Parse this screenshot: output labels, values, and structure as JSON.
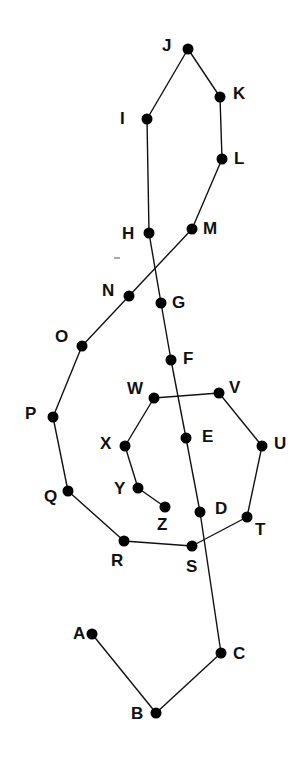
{
  "diagram": {
    "type": "connect-the-dots",
    "colors": {
      "line": "#111111",
      "dot": "#000000",
      "label": "#111111",
      "background": "#ffffff"
    },
    "path_order": [
      "A",
      "B",
      "C",
      "D",
      "E",
      "F",
      "G",
      "H",
      "I",
      "J",
      "K",
      "L",
      "M",
      "N",
      "O",
      "P",
      "Q",
      "R",
      "S",
      "T",
      "U",
      "V",
      "W",
      "X",
      "Y",
      "Z"
    ],
    "points": [
      {
        "id": "A",
        "label": "A",
        "x": 92,
        "y": 634,
        "lx": 73,
        "ly": 639
      },
      {
        "id": "B",
        "label": "B",
        "x": 156,
        "y": 713,
        "lx": 131,
        "ly": 719
      },
      {
        "id": "C",
        "label": "C",
        "x": 221,
        "y": 653,
        "lx": 233,
        "ly": 659
      },
      {
        "id": "D",
        "label": "D",
        "x": 200,
        "y": 512,
        "lx": 215,
        "ly": 514
      },
      {
        "id": "E",
        "label": "E",
        "x": 186,
        "y": 438,
        "lx": 202,
        "ly": 442
      },
      {
        "id": "F",
        "label": "F",
        "x": 171,
        "y": 360,
        "lx": 183,
        "ly": 364
      },
      {
        "id": "G",
        "label": "G",
        "x": 161,
        "y": 303,
        "lx": 172,
        "ly": 308
      },
      {
        "id": "H",
        "label": "H",
        "x": 149,
        "y": 233,
        "lx": 122,
        "ly": 239
      },
      {
        "id": "I",
        "label": "I",
        "x": 147,
        "y": 119,
        "lx": 120,
        "ly": 124
      },
      {
        "id": "J",
        "label": "J",
        "x": 188,
        "y": 49,
        "lx": 162,
        "ly": 51
      },
      {
        "id": "K",
        "label": "K",
        "x": 220,
        "y": 97,
        "lx": 233,
        "ly": 99
      },
      {
        "id": "L",
        "label": "L",
        "x": 222,
        "y": 159,
        "lx": 234,
        "ly": 164
      },
      {
        "id": "M",
        "label": "M",
        "x": 192,
        "y": 229,
        "lx": 203,
        "ly": 234
      },
      {
        "id": "N",
        "label": "N",
        "x": 129,
        "y": 296,
        "lx": 102,
        "ly": 296
      },
      {
        "id": "O",
        "label": "O",
        "x": 82,
        "y": 346,
        "lx": 55,
        "ly": 342
      },
      {
        "id": "P",
        "label": "P",
        "x": 53,
        "y": 417,
        "lx": 25,
        "ly": 419
      },
      {
        "id": "Q",
        "label": "Q",
        "x": 68,
        "y": 491,
        "lx": 44,
        "ly": 502
      },
      {
        "id": "R",
        "label": "R",
        "x": 124,
        "y": 541,
        "lx": 111,
        "ly": 566
      },
      {
        "id": "S",
        "label": "S",
        "x": 192,
        "y": 546,
        "lx": 186,
        "ly": 572
      },
      {
        "id": "T",
        "label": "T",
        "x": 247,
        "y": 517,
        "lx": 255,
        "ly": 535
      },
      {
        "id": "U",
        "label": "U",
        "x": 262,
        "y": 446,
        "lx": 274,
        "ly": 449
      },
      {
        "id": "V",
        "label": "V",
        "x": 219,
        "y": 393,
        "lx": 229,
        "ly": 393
      },
      {
        "id": "W",
        "label": "W",
        "x": 154,
        "y": 398,
        "lx": 127,
        "ly": 394
      },
      {
        "id": "X",
        "label": "X",
        "x": 125,
        "y": 446,
        "lx": 100,
        "ly": 449
      },
      {
        "id": "Y",
        "label": "Y",
        "x": 138,
        "y": 488,
        "lx": 114,
        "ly": 494
      },
      {
        "id": "Z",
        "label": "Z",
        "x": 165,
        "y": 507,
        "lx": 157,
        "ly": 530
      }
    ],
    "stray_mark": {
      "x1": 114,
      "y1": 258,
      "x2": 120,
      "y2": 258
    }
  }
}
